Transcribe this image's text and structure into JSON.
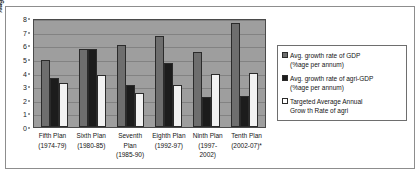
{
  "chart_data": {
    "type": "bar",
    "title": "",
    "xlabel": "",
    "ylabel": "%age growth rate",
    "ylim": [
      0,
      8
    ],
    "yticks": [
      0,
      1,
      2,
      3,
      4,
      5,
      6,
      7,
      8
    ],
    "grid": true,
    "legend_position": "right",
    "categories": [
      "Fifth Plan (1974-79)",
      "Sixth Plan (1980-85)",
      "Seventh Plan (1985-90)",
      "Eighth Plan (1992-97)",
      "Ninth Plan (1997-2002)",
      "Tenth Plan (2002-07)*"
    ],
    "category_lines": [
      [
        "Fifth Plan",
        "(1974-79)"
      ],
      [
        "Sixth Plan",
        "(1980-85)"
      ],
      [
        "Seventh",
        "Plan",
        "(1985-90)"
      ],
      [
        "Eighth Plan",
        "(1992-97)"
      ],
      [
        "Ninth Plan",
        "(1997-",
        "2002)"
      ],
      [
        "Tenth Plan",
        "(2002-07)*"
      ]
    ],
    "series": [
      {
        "name": "Avg. growth rate of GDP (%age per annum)",
        "name_lines": [
          "Avg. growth rate of GDP",
          "(%age per annum)"
        ],
        "color": "#6e6e6e",
        "values": [
          4.9,
          5.7,
          6.0,
          6.7,
          5.5,
          7.6
        ]
      },
      {
        "name": "Avg. growth rate of agri-GDP (%age per annum)",
        "name_lines": [
          "Avg. growth rate of agri-GDP",
          "(%age per annum)"
        ],
        "color": "#1c1c1c",
        "values": [
          3.6,
          5.7,
          3.1,
          4.7,
          2.2,
          2.3
        ]
      },
      {
        "name": "Targeted Average Annual Growth Rate of agri",
        "name_lines": [
          "Targeted Average Annual",
          "Grow th Rate of agri"
        ],
        "color": "#ffffff",
        "values": [
          3.25,
          3.8,
          2.5,
          3.1,
          3.9,
          4.0
        ]
      }
    ]
  }
}
